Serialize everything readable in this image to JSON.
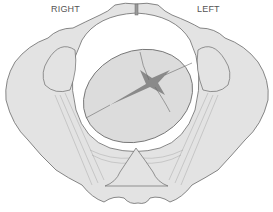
{
  "labels": {
    "right": "RIGHT",
    "left": "LEFT"
  },
  "colors": {
    "bone_fill": "#e3e3e3",
    "outline": "#6a6a6a",
    "head_fill": "#dcdcdc",
    "fontanelle": "#8a8a8a",
    "background": "#ffffff"
  }
}
